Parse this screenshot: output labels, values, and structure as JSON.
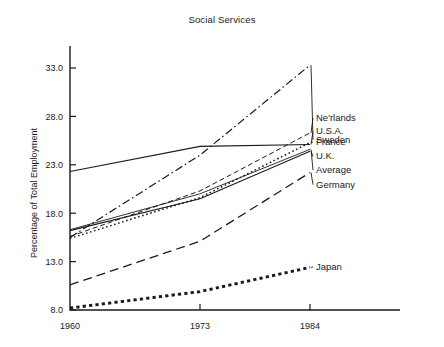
{
  "chart_data": {
    "type": "line",
    "title": "Social Services",
    "xlabel": "",
    "ylabel": "Percentage of Total Employment",
    "x": [
      1960,
      1973,
      1984
    ],
    "xticklabels": [
      "1960",
      "1973",
      "1984"
    ],
    "yticklabels": [
      "8.0",
      "13.0",
      "18.0",
      "23.0",
      "28.0",
      "33.0"
    ],
    "yticks": [
      8.0,
      13.0,
      18.0,
      23.0,
      28.0,
      33.0
    ],
    "xlim": [
      1960,
      1984
    ],
    "ylim": [
      8.0,
      35.0
    ],
    "grid": false,
    "legend": "right-inline-labels",
    "series": [
      {
        "name": "Sweden",
        "values": [
          15.5,
          24.0,
          33.3
        ],
        "style": "dash-dot",
        "label_y": 25.6
      },
      {
        "name": "Ne'rlands",
        "values": [
          15.6,
          20.3,
          26.3
        ],
        "style": "dashed",
        "label_y": 27.9
      },
      {
        "name": "U.S.A.",
        "values": [
          22.3,
          24.9,
          25.1
        ],
        "style": "solid",
        "label_y": 26.5
      },
      {
        "name": "France",
        "values": [
          15.4,
          19.6,
          25.3
        ],
        "style": "dotted",
        "label_y": 25.4
      },
      {
        "name": "U.K.",
        "values": [
          16.2,
          19.5,
          24.4
        ],
        "style": "solid",
        "label_y": 23.9
      },
      {
        "name": "Average",
        "values": [
          16.3,
          20.0,
          24.6
        ],
        "style": "solid-thin",
        "label_y": 22.5
      },
      {
        "name": "Germany",
        "values": [
          10.6,
          15.1,
          22.2
        ],
        "style": "long-dash",
        "label_y": 21.0
      },
      {
        "name": "Japan",
        "values": [
          8.2,
          9.9,
          12.4
        ],
        "style": "thick-dot",
        "label_y": 12.5
      }
    ]
  }
}
